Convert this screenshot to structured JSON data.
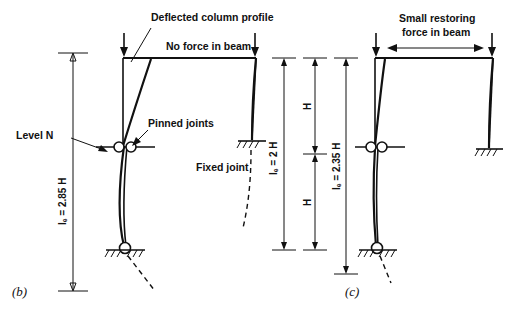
{
  "figure": {
    "width": 527,
    "height": 317,
    "background": "#ffffff",
    "ink": "#111111"
  },
  "panels": [
    {
      "key": "b",
      "caption": "(b)",
      "annotations": {
        "deflected_profile": "Deflected column profile",
        "beam_force": "No force in beam",
        "level": "Level N",
        "pinned": "Pinned joints",
        "fixed": "Fixed joint"
      },
      "dimension": {
        "label": "lₑ = 2.85 H"
      }
    },
    {
      "key": "c",
      "caption": "(c)",
      "annotations": {
        "beam_force_line1": "Small restoring",
        "beam_force_line2": "force in beam"
      },
      "dimension": {
        "label": "lₑ = 2.35 H"
      }
    }
  ],
  "middle_dimensions": [
    {
      "name": "effective-length-2h",
      "label": "lₑ = 2 H"
    },
    {
      "name": "storey-height-upper",
      "label": "H"
    },
    {
      "name": "storey-height-lower",
      "label": "H"
    }
  ]
}
